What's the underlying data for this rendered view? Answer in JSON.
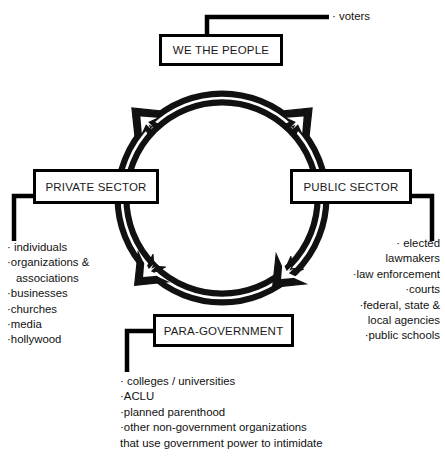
{
  "diagram": {
    "colors": {
      "ink": "#000000",
      "background": "#ffffff",
      "arrow_fill": "#111111"
    },
    "nodes": [
      {
        "id": "we-the-people",
        "label": "WE THE PEOPLE"
      },
      {
        "id": "private-sector",
        "label": "PRIVATE SECTOR"
      },
      {
        "id": "public-sector",
        "label": "PUBLIC SECTOR"
      },
      {
        "id": "para-government",
        "label": "PARA-GOVERNMENT"
      }
    ],
    "lists": {
      "voters": {
        "attached_to": "WE THE PEOPLE",
        "items": [
          "· voters"
        ]
      },
      "private_sector": {
        "attached_to": "PRIVATE SECTOR",
        "items": [
          "· individuals",
          "·organizations &",
          "associations",
          "·businesses",
          "·churches",
          "·media",
          "·hollywood"
        ]
      },
      "public_sector": {
        "attached_to": "PUBLIC SECTOR",
        "items": [
          "· elected",
          "lawmakers",
          "·law enforcement",
          "·courts",
          "·federal, state &",
          "local agencies",
          "·public schools"
        ]
      },
      "para_government": {
        "attached_to": "PARA-GOVERNMENT",
        "items": [
          "· colleges / universities",
          "·ACLU",
          "·planned parenthood",
          "·other non-government organizations",
          "that use government power to intimidate"
        ]
      }
    },
    "flow": {
      "shape": "ring",
      "arrowheads": 4,
      "description": "Double-line circular ring connecting the four boxes with four arrowheads"
    }
  }
}
